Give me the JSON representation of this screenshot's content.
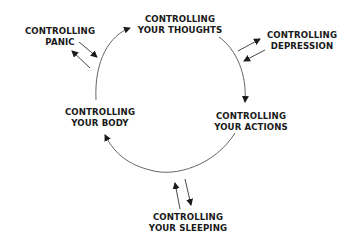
{
  "diagram": {
    "type": "cycle",
    "line_color": "#555555",
    "arrow_color": "#1a1a1a",
    "text_color": "#1a1a1a",
    "cycle_nodes": [
      {
        "id": "thoughts",
        "line1": "CONTROLLING",
        "line2": "YOUR THOUGHTS"
      },
      {
        "id": "actions",
        "line1": "CONTROLLING",
        "line2": "YOUR ACTIONS"
      },
      {
        "id": "body",
        "line1": "CONTROLLING",
        "line2": "YOUR BODY"
      }
    ],
    "satellite_nodes": [
      {
        "id": "panic",
        "line1": "CONTROLLING",
        "line2": "PANIC",
        "linked_to": "body-thoughts arc"
      },
      {
        "id": "depression",
        "line1": "CONTROLLING",
        "line2": "DEPRESSION",
        "linked_to": "thoughts-actions arc"
      },
      {
        "id": "sleeping",
        "line1": "CONTROLLING",
        "line2": "YOUR SLEEPING",
        "linked_to": "actions-body arc"
      }
    ],
    "cycle_direction": "clockwise: thoughts → actions → body → thoughts",
    "satellite_links": "bidirectional"
  }
}
